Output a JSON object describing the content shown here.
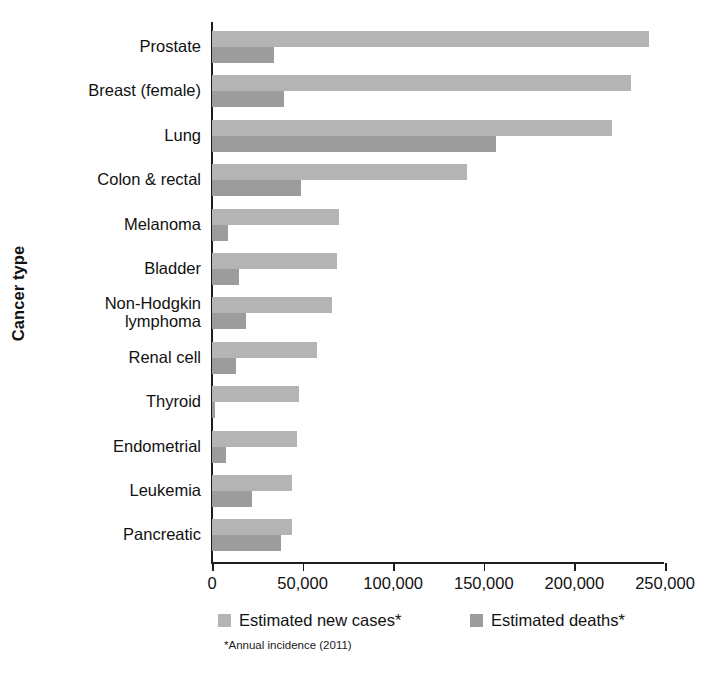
{
  "chart_data": {
    "type": "bar",
    "orientation": "horizontal",
    "title": "",
    "xlabel": "",
    "ylabel": "Cancer type",
    "xlim": [
      0,
      250000
    ],
    "xticks": [
      0,
      50000,
      100000,
      150000,
      200000,
      250000
    ],
    "xtick_labels": [
      "0",
      "50,000",
      "100,000",
      "150,000",
      "200,000",
      "250,000"
    ],
    "grid": false,
    "legend_position": "bottom",
    "footnote": "*Annual incidence (2011)",
    "categories": [
      "Prostate",
      "Breast (female)",
      "Lung",
      "Colon & rectal",
      "Melanoma",
      "Bladder",
      "Non-Hodgkin lymphoma",
      "Renal cell",
      "Thyroid",
      "Endometrial",
      "Leukemia",
      "Pancreatic"
    ],
    "category_lines": [
      [
        "Prostate"
      ],
      [
        "Breast (female)"
      ],
      [
        "Lung"
      ],
      [
        "Colon & rectal"
      ],
      [
        "Melanoma"
      ],
      [
        "Bladder"
      ],
      [
        "Non-Hodgkin",
        "lymphoma"
      ],
      [
        "Renal cell"
      ],
      [
        "Thyroid"
      ],
      [
        "Endometrial"
      ],
      [
        "Leukemia"
      ],
      [
        "Pancreatic"
      ]
    ],
    "series": [
      {
        "name": "Estimated new cases*",
        "color": "#b4b4b4",
        "values": [
          241000,
          231000,
          221000,
          141000,
          70000,
          69000,
          66000,
          58000,
          48000,
          47000,
          44000,
          44000
        ]
      },
      {
        "name": "Estimated deaths*",
        "color": "#9c9c9c",
        "values": [
          34000,
          40000,
          157000,
          49000,
          9000,
          15000,
          19000,
          13000,
          1700,
          8000,
          22000,
          38000
        ]
      }
    ]
  },
  "axis": {
    "y_title": "Cancer type"
  },
  "legend": {
    "items": [
      {
        "label": "Estimated new cases*",
        "color": "#b4b4b4"
      },
      {
        "label": "Estimated deaths*",
        "color": "#9c9c9c"
      }
    ]
  },
  "footnote": {
    "text": "*Annual incidence (2011)"
  }
}
